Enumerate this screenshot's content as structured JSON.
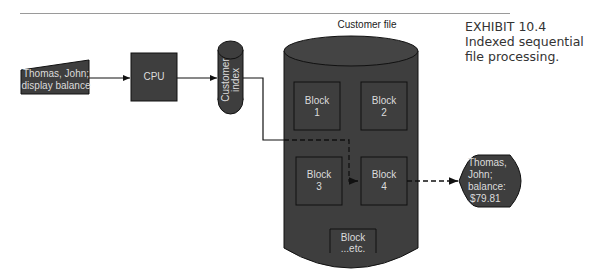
{
  "exhibit": {
    "number": "EXHIBIT 10.4",
    "caption": "Indexed sequential file processing."
  },
  "diagram": {
    "input": {
      "line1": "Thomas, John;",
      "line2": "display balance"
    },
    "cpu": {
      "label": "CPU"
    },
    "index": {
      "line1": "Customer",
      "line2": "index"
    },
    "file": {
      "label": "Customer file",
      "blocks": [
        {
          "line1": "Block",
          "line2": "1"
        },
        {
          "line1": "Block",
          "line2": "2"
        },
        {
          "line1": "Block",
          "line2": "3"
        },
        {
          "line1": "Block",
          "line2": "4"
        },
        {
          "line1": "Block",
          "line2": "...etc."
        }
      ]
    },
    "output": {
      "line1": "Thomas,",
      "line2": "John;",
      "line3": "balance:",
      "line4": "$79.81"
    },
    "colors": {
      "shape_fill": "#3e3e3e",
      "stroke": "#111111",
      "text": "#dcdcdc"
    }
  }
}
